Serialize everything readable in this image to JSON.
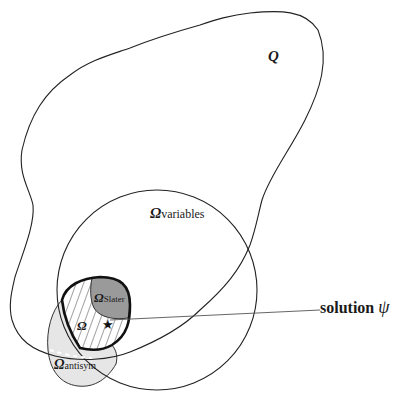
{
  "diagram": {
    "labels": {
      "Q": "Q",
      "omega": "Ω",
      "variables_sub": "variables",
      "slater_sub": "Slater",
      "antisym_sub": "antisym",
      "omega_main": "Ω",
      "solution": "solution ",
      "psi": "ψ"
    },
    "regions": [
      {
        "name": "Q",
        "description": "large irregular outer set"
      },
      {
        "name": "Ω_variables",
        "description": "circle"
      },
      {
        "name": "Ω_antisym",
        "description": "light gray region"
      },
      {
        "name": "Ω",
        "description": "hatched region with thick boundary"
      },
      {
        "name": "Ω_Slater",
        "description": "dark gray region inside Ω"
      }
    ],
    "colors": {
      "stroke": "#222222",
      "antisym_fill": "#e6e6e6",
      "slater_fill": "#9a9a9a",
      "hatch": "#444444"
    }
  }
}
